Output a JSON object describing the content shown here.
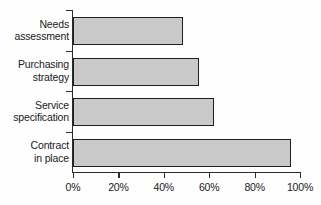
{
  "chart_data": {
    "type": "bar",
    "orientation": "horizontal",
    "title": "",
    "xlabel": "",
    "ylabel": "",
    "categories": [
      "Needs assessment",
      "Purchasing strategy",
      "Service specification",
      "Contract in place"
    ],
    "category_lines": [
      [
        "Needs",
        "assessment"
      ],
      [
        "Purchasing",
        "strategy"
      ],
      [
        "Service",
        "specification"
      ],
      [
        "Contract",
        "in place"
      ]
    ],
    "values": [
      48.5,
      55.5,
      62,
      96
    ],
    "xlim": [
      0,
      100
    ],
    "xticks": [
      0,
      20,
      40,
      60,
      80,
      100
    ],
    "xtick_labels": [
      "0%",
      "20%",
      "40%",
      "60%",
      "80%",
      "100%"
    ],
    "grid": false,
    "legend": false,
    "bar_fill_color": "#c9c9c9",
    "bar_edge_color": "#1f1f1f",
    "axis_color": "#2b2b2b",
    "text_color": "#1a1a1a",
    "background_color": "#fefefe"
  }
}
